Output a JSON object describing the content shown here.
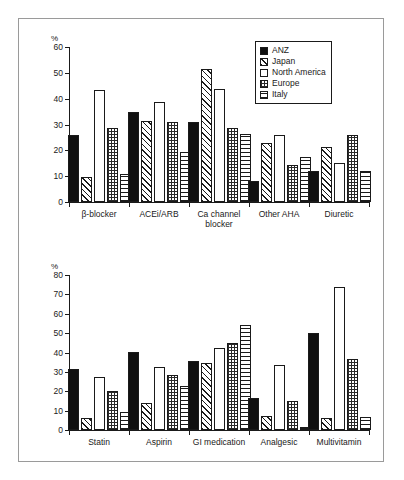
{
  "figure": {
    "axis_unit_label": "%",
    "legend": {
      "position": "top-right",
      "entries": [
        {
          "label": "ANZ",
          "pattern": "solid-black",
          "key": "anz"
        },
        {
          "label": "Japan",
          "pattern": "diagonal-hatch",
          "key": "jpn"
        },
        {
          "label": "North America",
          "pattern": "white-empty",
          "key": "na"
        },
        {
          "label": "Europe",
          "pattern": "cross-hatch-dotted",
          "key": "eur"
        },
        {
          "label": "Italy",
          "pattern": "horizontal-lines",
          "key": "ita"
        }
      ]
    }
  },
  "chart_data": [
    {
      "type": "bar",
      "title": "",
      "xlabel": "",
      "ylabel": "%",
      "ylim": [
        0,
        60
      ],
      "yticks": [
        0,
        10,
        20,
        30,
        40,
        50,
        60
      ],
      "grid": false,
      "legend_position": "top-right",
      "categories": [
        "β-blocker",
        "ACEi/ARB",
        "Ca channel\nblocker",
        "Other AHA",
        "Diuretic"
      ],
      "series": [
        {
          "name": "ANZ",
          "values": [
            26.0,
            35.0,
            31.0,
            8.0,
            12.0
          ]
        },
        {
          "name": "Japan",
          "values": [
            9.5,
            31.5,
            51.5,
            23.0,
            21.2
          ]
        },
        {
          "name": "North America",
          "values": [
            43.3,
            38.7,
            43.7,
            25.8,
            15.2
          ]
        },
        {
          "name": "Europe",
          "values": [
            28.8,
            30.8,
            28.8,
            14.5,
            26.0
          ]
        },
        {
          "name": "Italy",
          "values": [
            11.0,
            19.3,
            26.5,
            17.5,
            12.0
          ]
        }
      ]
    },
    {
      "type": "bar",
      "title": "",
      "xlabel": "",
      "ylabel": "%",
      "ylim": [
        0,
        80
      ],
      "yticks": [
        0,
        10,
        20,
        30,
        40,
        50,
        60,
        70,
        80
      ],
      "grid": false,
      "legend_position": "none",
      "categories": [
        "Statin",
        "Aspirin",
        "GI medication",
        "Analgesic",
        "Multivitamin"
      ],
      "series": [
        {
          "name": "ANZ",
          "values": [
            31.5,
            40.1,
            35.6,
            16.4,
            50.1
          ]
        },
        {
          "name": "Japan",
          "values": [
            6.2,
            13.7,
            34.4,
            7.4,
            6.0
          ]
        },
        {
          "name": "North America",
          "values": [
            27.3,
            32.5,
            42.3,
            33.4,
            73.9
          ]
        },
        {
          "name": "Europe",
          "values": [
            20.0,
            28.4,
            45.0,
            14.9,
            36.4
          ]
        },
        {
          "name": "Italy",
          "values": [
            9.3,
            22.7,
            54.3,
            1.3,
            6.9
          ]
        }
      ]
    }
  ]
}
